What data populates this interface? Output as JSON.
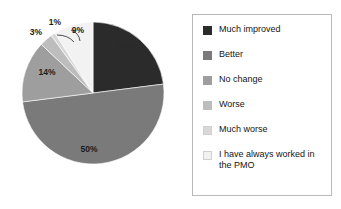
{
  "chart_data": {
    "type": "pie",
    "title": "",
    "categories": [
      "Much improved",
      "Better",
      "No change",
      "Worse",
      "Much worse",
      "I have always worked in the PMO"
    ],
    "values": [
      23,
      50,
      14,
      3,
      1,
      9
    ],
    "value_labels": [
      "23%",
      "50%",
      "14%",
      "3%",
      "1%",
      "9%"
    ],
    "colors": [
      "#2b2b2b",
      "#7a7a7a",
      "#9e9e9e",
      "#bdbdbd",
      "#d8d8d8",
      "#f2f2f2"
    ],
    "start_angle_deg": 0,
    "direction": "clockwise",
    "legend_position": "right",
    "grid": false,
    "xlabel": "",
    "ylabel": ""
  },
  "pie": {
    "labels": {
      "much_improved": "23%",
      "better": "50%",
      "no_change": "14%",
      "worse": "3%",
      "much_worse": "1%",
      "pmo": "9%"
    }
  },
  "legend": {
    "items": [
      {
        "label": "Much improved",
        "color": "#2b2b2b"
      },
      {
        "label": "Better",
        "color": "#7a7a7a"
      },
      {
        "label": "No change",
        "color": "#9e9e9e"
      },
      {
        "label": "Worse",
        "color": "#bdbdbd"
      },
      {
        "label": "Much worse",
        "color": "#d8d8d8"
      },
      {
        "label": "I have always worked in\nthe PMO",
        "color": "#f2f2f2"
      }
    ]
  }
}
